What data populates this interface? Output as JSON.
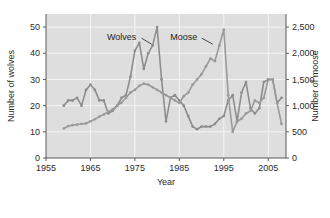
{
  "chart_data": {
    "type": "line",
    "title": "",
    "xlabel": "Year",
    "ylabel": "Number of wolves",
    "y2label": "Number of moose",
    "xlim": [
      1955,
      2009
    ],
    "ylim": [
      0,
      55
    ],
    "y2lim": [
      0,
      2750
    ],
    "grid": true,
    "legend_position": "inline-annotation",
    "xticks": [
      1955,
      1965,
      1975,
      1985,
      1995,
      2005
    ],
    "xtick_labels": [
      "1955",
      "1965",
      "1975",
      "1985",
      "1995",
      "2005"
    ],
    "yticks": [
      0,
      10,
      20,
      30,
      40,
      50
    ],
    "ytick_labels": [
      "0",
      "10",
      "20",
      "30",
      "40",
      "50"
    ],
    "y2ticks": [
      0,
      500,
      1000,
      1500,
      2000,
      2500
    ],
    "y2tick_labels": [
      "0",
      "500",
      "1,000",
      "1,500",
      "2,000",
      "2,500"
    ],
    "marker": "circle",
    "series": [
      {
        "name": "Wolves",
        "axis": "left",
        "color": "#8d8d8d",
        "annotation": "Wolves",
        "x": [
          1959,
          1960,
          1961,
          1962,
          1963,
          1964,
          1965,
          1966,
          1967,
          1968,
          1969,
          1970,
          1971,
          1972,
          1973,
          1974,
          1975,
          1976,
          1977,
          1978,
          1979,
          1980,
          1981,
          1982,
          1983,
          1984,
          1985,
          1986,
          1987,
          1988,
          1989,
          1990,
          1991,
          1992,
          1993,
          1994,
          1995,
          1996,
          1997,
          1998,
          1999,
          2000,
          2001,
          2002,
          2003,
          2004,
          2005,
          2006,
          2007,
          2008
        ],
        "values": [
          20,
          22,
          22,
          23,
          20,
          26,
          28,
          26,
          22,
          22,
          17,
          18,
          20,
          23,
          24,
          31,
          41,
          44,
          34,
          40,
          43,
          50,
          30,
          14,
          23,
          24,
          22,
          20,
          16,
          12,
          11,
          12,
          12,
          12,
          13,
          15,
          16,
          22,
          24,
          14,
          25,
          29,
          19,
          17,
          19,
          29,
          30,
          30,
          21,
          23
        ]
      },
      {
        "name": "Moose",
        "axis": "right",
        "color": "#9a9a9a",
        "annotation": "Moose",
        "x": [
          1959,
          1960,
          1961,
          1962,
          1963,
          1964,
          1965,
          1966,
          1967,
          1968,
          1969,
          1970,
          1971,
          1972,
          1973,
          1974,
          1975,
          1976,
          1977,
          1978,
          1979,
          1980,
          1981,
          1982,
          1983,
          1984,
          1985,
          1986,
          1987,
          1988,
          1989,
          1990,
          1991,
          1992,
          1993,
          1994,
          1995,
          1996,
          1997,
          1998,
          1999,
          2000,
          2001,
          2002,
          2003,
          2004,
          2005,
          2006,
          2007,
          2008
        ],
        "values": [
          563,
          610,
          628,
          639,
          650,
          661,
          700,
          740,
          790,
          830,
          880,
          930,
          1000,
          1060,
          1150,
          1250,
          1300,
          1380,
          1420,
          1400,
          1350,
          1300,
          1250,
          1200,
          1150,
          1100,
          1050,
          1180,
          1250,
          1400,
          1500,
          1600,
          1750,
          1900,
          1850,
          2150,
          2450,
          1200,
          500,
          700,
          750,
          850,
          900,
          1100,
          1050,
          1150,
          1500,
          1500,
          1050,
          650
        ]
      }
    ],
    "annotations": [
      {
        "text": "Wolves",
        "x": 1972,
        "y": 45
      },
      {
        "text": "Moose",
        "x": 1986,
        "y": 45
      }
    ]
  },
  "axes": {
    "x_title": "Year",
    "y_left_title": "Number of wolves",
    "y_right_title": "Number of moose"
  }
}
